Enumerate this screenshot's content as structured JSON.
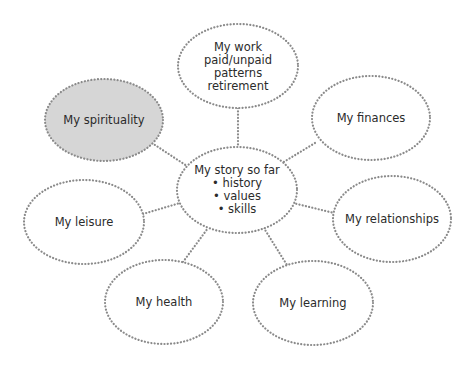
{
  "diagram": {
    "center": {
      "title": "My story so far",
      "bullets": [
        "• history",
        "• values",
        "• skills"
      ]
    },
    "nodes": {
      "work": {
        "lines": [
          "My work",
          "paid/unpaid",
          "patterns",
          "retirement"
        ]
      },
      "spirituality": {
        "label": "My spirituality",
        "highlighted": true
      },
      "finances": {
        "label": "My finances"
      },
      "leisure": {
        "label": "My leisure"
      },
      "relationships": {
        "label": "My relationships"
      },
      "health": {
        "label": "My health"
      },
      "learning": {
        "label": "My learning"
      }
    },
    "colors": {
      "dots": "#8a8a8a",
      "highlight_fill": "#d6d6d6",
      "text": "#2b2b2b"
    }
  }
}
